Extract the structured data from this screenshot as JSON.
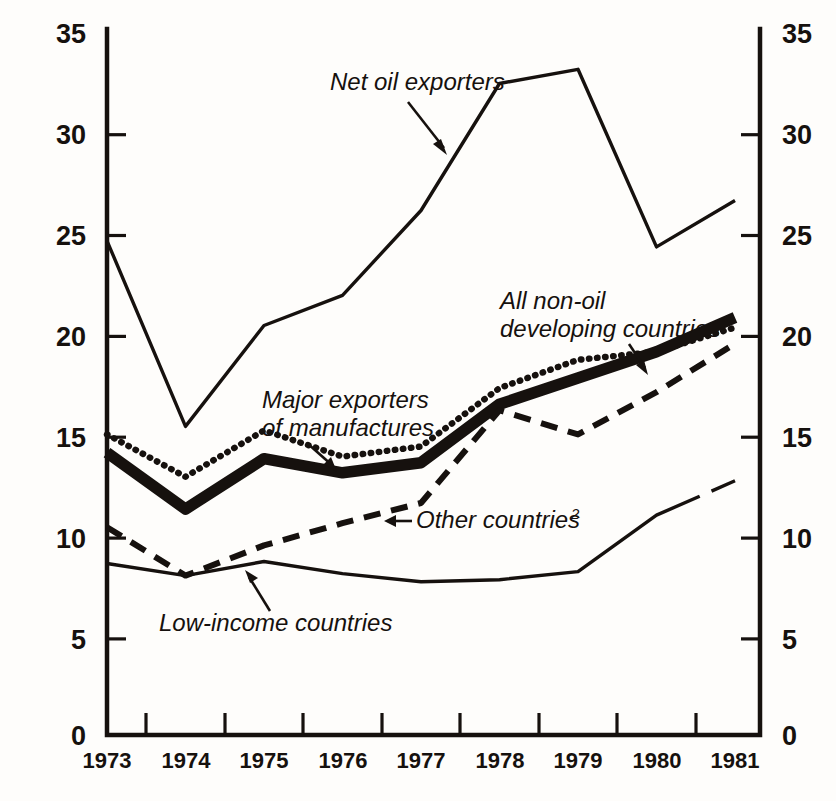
{
  "chart_data": {
    "type": "line",
    "title": "",
    "subtitle": "",
    "xlabel": "",
    "ylabel": "",
    "xlim": [
      1973,
      1981
    ],
    "ylim": [
      0,
      35
    ],
    "grid": false,
    "legend_position": "inline-annotations",
    "x": [
      1973,
      1974,
      1975,
      1976,
      1977,
      1978,
      1979,
      1980,
      1981
    ],
    "categories": [
      "1973",
      "1974",
      "1975",
      "1976",
      "1977",
      "1978",
      "1979",
      "1980",
      "1981"
    ],
    "y_ticks": [
      0,
      5,
      10,
      15,
      20,
      25,
      30,
      35
    ],
    "y_tick_labels": [
      "0",
      "5",
      "10",
      "15",
      "20",
      "25",
      "30",
      "35"
    ],
    "y_axis_left_labels": [
      "35",
      "30",
      "25",
      "20",
      "15",
      "10",
      "5",
      "0"
    ],
    "y_axis_right_labels": [
      "35",
      "30",
      "25",
      "20",
      "15",
      "10",
      "5",
      "0"
    ],
    "series": [
      {
        "name": "Net oil exporters",
        "style": "solid-thin",
        "values": [
          24.5,
          15.3,
          20.3,
          21.8,
          26.0,
          32.3,
          33.0,
          24.2,
          26.5
        ]
      },
      {
        "name": "Major exporters of manufactures",
        "style": "dotted",
        "values": [
          14.9,
          12.8,
          15.1,
          13.8,
          14.3,
          17.2,
          18.6,
          19.0,
          20.2
        ]
      },
      {
        "name": "All non-oil developing countries",
        "style": "bold",
        "values": [
          14.0,
          11.2,
          13.7,
          13.0,
          13.5,
          16.4,
          17.7,
          19.0,
          20.7
        ]
      },
      {
        "name": "Other countries",
        "style": "dashed",
        "values": [
          10.3,
          7.9,
          9.4,
          10.5,
          11.5,
          16.1,
          14.9,
          17.0,
          19.4
        ]
      },
      {
        "name": "Low-income countries",
        "style": "solid-thin",
        "values": [
          8.5,
          7.9,
          8.6,
          8.0,
          7.6,
          7.7,
          8.1,
          10.9,
          12.6
        ]
      }
    ],
    "annotations": [
      {
        "name": "net-oil-exporters",
        "text": "Net oil exporters",
        "superscript": "",
        "lines": [
          "Net oil exporters"
        ]
      },
      {
        "name": "all-non-oil-developing-countries",
        "text": "All non-oil developing countries",
        "superscript": "",
        "lines": [
          "All non-oil",
          "developing countries"
        ]
      },
      {
        "name": "major-exporters-of-manufactures",
        "text": "Major exporters of manufactures",
        "superscript": "",
        "lines": [
          "Major exporters",
          "of manufactures"
        ]
      },
      {
        "name": "other-countries",
        "text": "Other countries",
        "superscript": "2",
        "lines": [
          "Other countries"
        ]
      },
      {
        "name": "low-income-countries",
        "text": "Low-income countries",
        "superscript": "",
        "lines": [
          "Low-income countries"
        ]
      }
    ],
    "colors": {
      "ink": "#16110e",
      "background": "#fefdfb"
    }
  },
  "axis": {
    "left": {
      "t0": "35",
      "t1": "30",
      "t2": "25",
      "t3": "20",
      "t4": "15",
      "t5": "10",
      "t6": "5",
      "t7": "0"
    },
    "right": {
      "t0": "35",
      "t1": "30",
      "t2": "25",
      "t3": "20",
      "t4": "15",
      "t5": "10",
      "t6": "5",
      "t7": "0"
    },
    "x": {
      "y0": "1973",
      "y1": "1974",
      "y2": "1975",
      "y3": "1976",
      "y4": "1977",
      "y5": "1978",
      "y6": "1979",
      "y7": "1980",
      "y8": "1981"
    }
  },
  "labels": {
    "net_oil_exporters": "Net oil exporters",
    "all_non_oil_l1": "All non-oil",
    "all_non_oil_l2": "developing countries",
    "major_exporters_l1": "Major exporters",
    "major_exporters_l2": "of manufactures",
    "other_countries": "Other countries",
    "other_countries_sup": "2",
    "low_income_countries": "Low-income countries"
  }
}
